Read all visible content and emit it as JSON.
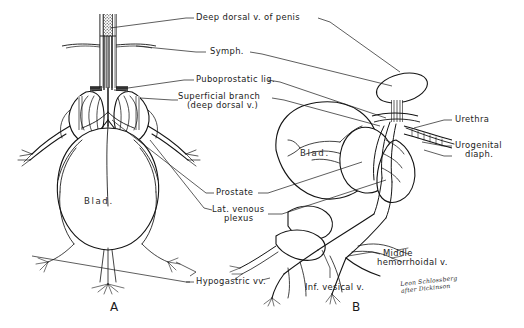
{
  "plate": {
    "title": "Venous drainage of the prostate and bladder",
    "background_color": "#ffffff",
    "ink_color": "#151515",
    "width": 524,
    "height": 328
  },
  "panels": [
    {
      "id": "A",
      "letter": "A",
      "view": "anterior",
      "organ_label": "Blad."
    },
    {
      "id": "B",
      "letter": "B",
      "view": "lateral",
      "organ_label": "Blad."
    }
  ],
  "labels": {
    "deep_dorsal_vein": "Deep dorsal v. of penis",
    "symphysis": "Symph.",
    "puboprostatic_ligament": "Puboprostatic lig.",
    "superficial_branch_line1": "Superficial branch",
    "superficial_branch_line2": "(deep dorsal v.)",
    "prostate": "Prostate",
    "lateral_venous_plexus_line1": "Lat. venous",
    "lateral_venous_plexus_line2": "plexus",
    "hypogastric_veins": "Hypogastric vv.",
    "urethra": "Urethra",
    "urogenital_diaphragm_line1": "Urogenital",
    "urogenital_diaphragm_line2": "diaph.",
    "middle_hemorrhoidal_line1": "Middle",
    "middle_hemorrhoidal_line2": "hemorrhoidal v.",
    "inferior_vesical_vein": "Inf. vesical v.",
    "bladder_a": "Blad.",
    "bladder_b": "Blad."
  },
  "signature": {
    "line1": "Leon Schlossberg",
    "line2": "after Dickinson"
  }
}
